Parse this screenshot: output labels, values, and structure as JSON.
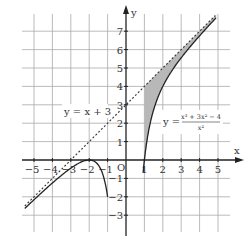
{
  "chart_data": {
    "type": "line",
    "title": "",
    "xlabel": "x",
    "ylabel": "y",
    "origin_label": "O",
    "xlim": [
      -5.5,
      5.6
    ],
    "ylim": [
      -3.9,
      7.7
    ],
    "grid": true,
    "x_ticks": [
      "-5",
      "-4",
      "-3",
      "-2",
      "-1",
      "1",
      "2",
      "3",
      "4",
      "5"
    ],
    "y_ticks": [
      "7",
      "6",
      "5",
      "4",
      "3",
      "2",
      "1",
      "-1",
      "-2",
      "-3"
    ],
    "series": [
      {
        "name": "y = x + 3",
        "style": "dashed",
        "formula": "x + 3"
      },
      {
        "name": "y = (x³ + 3x² − 4) / x²",
        "style": "solid",
        "formula": "x + 3 - 4/x^2"
      }
    ],
    "shaded_region": {
      "between": [
        "y = x + 3",
        "y = (x³ + 3x² − 4) / x²"
      ],
      "x_from": 1,
      "x_to": 5,
      "color": "#b8b8b8"
    },
    "annotations": [
      {
        "text": "y = x + 3",
        "near": [
          -2.2,
          3
        ]
      },
      {
        "text": "y = (x³ + 3x² − 4)/x²",
        "near": [
          2.6,
          2
        ]
      }
    ]
  },
  "labels": {
    "x_axis": "x",
    "y_axis": "y",
    "origin": "O",
    "asymptote": "y = x + 3",
    "curve_prefix": "y =",
    "curve_numerator": "x³ + 3x² − 4",
    "curve_denominator": "x²"
  },
  "colors": {
    "grid": "#aaaaaa",
    "axis": "#222222",
    "curve": "#222222",
    "shade": "#b8b8b8"
  }
}
